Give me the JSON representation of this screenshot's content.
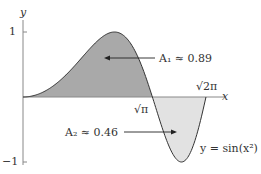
{
  "chart_data": {
    "type": "area",
    "title": "",
    "function": "y = sin(x^2)",
    "xlabel": "x",
    "ylabel": "y",
    "xlim": [
      0,
      2.5066
    ],
    "ylim": [
      -1,
      1
    ],
    "yticks": [
      1,
      -1
    ],
    "xtick_labels": [
      "√π",
      "√2π"
    ],
    "regions": [
      {
        "name": "A1",
        "label": "A₁ ≈ 0.89",
        "x_range": [
          0,
          1.7725
        ],
        "area": 0.89,
        "fill": "#a8a8a8"
      },
      {
        "name": "A2",
        "label": "A₂ ≈ 0.46",
        "x_range": [
          1.7725,
          2.5066
        ],
        "area": 0.46,
        "fill": "#e0e0e0"
      }
    ],
    "curve_label": "y = sin(x²)"
  },
  "labels": {
    "y_axis": "y",
    "x_axis": "x",
    "tick_one": "1",
    "tick_neg_one": "−1",
    "sqrt_pi": "√π",
    "sqrt_2pi": "√2π",
    "a1": "A₁ ≈ 0.89",
    "a2": "A₂ ≈ 0.46",
    "curve": "y = sin(x²)"
  }
}
